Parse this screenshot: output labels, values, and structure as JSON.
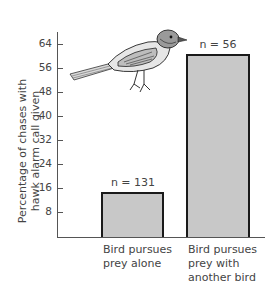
{
  "chart_data": {
    "type": "bar",
    "title": "",
    "xlabel": "",
    "ylabel": "Percentage of chases with hawk alarm call given",
    "ylabel_lines": [
      "Percentage of chases with",
      "hawk alarm call given"
    ],
    "categories": [
      "Bird pursues prey alone",
      "Bird pursues prey with another bird"
    ],
    "category_lines": [
      [
        "Bird pursues",
        "prey alone"
      ],
      [
        "Bird pursues",
        "prey with",
        "another bird"
      ]
    ],
    "values": [
      15,
      61
    ],
    "annotations": [
      "n = 131",
      "n = 56"
    ],
    "sample_sizes": [
      131,
      56
    ],
    "yticks": [
      8,
      16,
      24,
      32,
      40,
      48,
      56,
      64
    ],
    "ylim": [
      0,
      68
    ],
    "grid": false,
    "legend": null,
    "bar_color": "#c8c8c8",
    "bar_edge_color": "#1a1a1a"
  },
  "illustration": {
    "icon": "bird-illustration",
    "description": "perched songbird drawing"
  }
}
